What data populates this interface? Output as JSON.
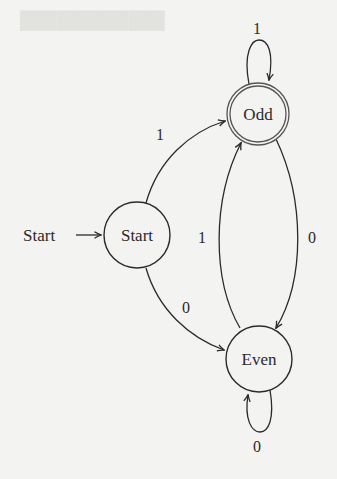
{
  "diagram": {
    "type": "finite-state-automaton",
    "start_marker_label": "Start",
    "nodes": [
      {
        "id": "start",
        "label": "Start",
        "accepting": false,
        "cx": 137,
        "cy": 235,
        "r": 33
      },
      {
        "id": "odd",
        "label": "Odd",
        "accepting": true,
        "cx": 258,
        "cy": 114,
        "r": 31
      },
      {
        "id": "even",
        "label": "Even",
        "accepting": false,
        "cx": 259,
        "cy": 359,
        "r": 33
      }
    ],
    "edges": [
      {
        "from": "start",
        "to": "odd",
        "label": "1"
      },
      {
        "from": "start",
        "to": "even",
        "label": "0"
      },
      {
        "from": "odd",
        "to": "odd",
        "label": "1"
      },
      {
        "from": "odd",
        "to": "even",
        "label": "0"
      },
      {
        "from": "even",
        "to": "odd",
        "label": "1"
      },
      {
        "from": "even",
        "to": "even",
        "label": "0"
      }
    ],
    "colors": {
      "stroke": "#2a2a2a",
      "accepting_ring": "#555555",
      "background": "#f3f3f1"
    }
  }
}
